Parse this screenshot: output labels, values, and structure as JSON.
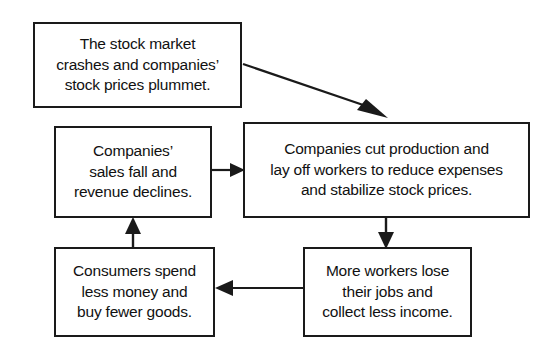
{
  "diagram": {
    "type": "cycle-flowchart",
    "background_color": "#ffffff",
    "line_color": "#1a1a1a",
    "text_color": "#111111",
    "nodes": [
      {
        "id": "stock-crash",
        "text": "The stock market\ncrashes and companies’\nstock prices plummet.",
        "lines": [
          "The stock market",
          "crashes and companies’",
          "stock prices plummet."
        ]
      },
      {
        "id": "sales-fall",
        "text": "Companies’\nsales fall and\nrevenue declines.",
        "lines": [
          "Companies’",
          "sales fall and",
          "revenue declines."
        ]
      },
      {
        "id": "cut-production",
        "text": "Companies cut production and\nlay off workers to reduce expenses\nand stabilize stock prices.",
        "lines": [
          "Companies cut production and",
          "lay off workers to reduce expenses",
          "and stabilize stock prices."
        ]
      },
      {
        "id": "workers-lose",
        "text": "More workers lose\ntheir jobs and\ncollect less income.",
        "lines": [
          "More workers lose",
          "their jobs and",
          "collect less income."
        ]
      },
      {
        "id": "consumers",
        "text": "Consumers spend\nless money and\nbuy fewer goods.",
        "lines": [
          "Consumers spend",
          "less money and",
          "buy fewer goods."
        ]
      }
    ],
    "edges": [
      {
        "id": "stock-crash-to-cut-production",
        "from": "stock-crash",
        "to": "cut-production",
        "direction": "diagonal-down-right"
      },
      {
        "id": "sales-fall-to-cut-production",
        "from": "sales-fall",
        "to": "cut-production",
        "direction": "right"
      },
      {
        "id": "cut-production-to-workers-lose",
        "from": "cut-production",
        "to": "workers-lose",
        "direction": "down"
      },
      {
        "id": "workers-lose-to-consumers",
        "from": "workers-lose",
        "to": "consumers",
        "direction": "left"
      },
      {
        "id": "consumers-to-sales-fall",
        "from": "consumers",
        "to": "sales-fall",
        "direction": "up"
      }
    ]
  }
}
